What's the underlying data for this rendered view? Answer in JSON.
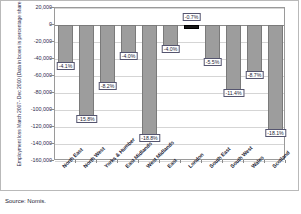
{
  "figure": {
    "y_axis_title_line1": "Employment loss March 2007- Dec 2010",
    "y_axis_title_line2": "(Data in boxes is percentage share of losses)",
    "source_note": "Source: Nomis."
  },
  "chart_data": {
    "type": "bar",
    "title": "",
    "subtitle": "",
    "xlabel": "",
    "ylabel": "Employment loss March 2007- Dec 2010 (Data in boxes is percentage share of losses)",
    "categories": [
      "North East",
      "North West",
      "Yorks & Humber",
      "East Midlands",
      "West Midlands",
      "East",
      "London",
      "South East",
      "South West",
      "Wales",
      "Scotland"
    ],
    "values": [
      -48000,
      -110000,
      -72000,
      -36000,
      -133000,
      -28000,
      -5000,
      -44000,
      -80000,
      -59000,
      -127000
    ],
    "data_labels": [
      "-4.1%",
      "-15.8%",
      "-8.2%",
      "-4.0%",
      "-18.8%",
      "-4.0%",
      "-0.7%",
      "-5.5%",
      "-11.4%",
      "-8.7%",
      "-18.1%"
    ],
    "ylim": [
      -160000,
      20000
    ],
    "ytick_labels": [
      "20,000",
      "0",
      "-20,000",
      "-40,000",
      "-60,000",
      "-80,000",
      "-100,000",
      "-120,000",
      "-140,000",
      "-160,000"
    ],
    "ytick_values": [
      20000,
      0,
      -20000,
      -40000,
      -60000,
      -80000,
      -100000,
      -120000,
      -140000,
      -160000
    ],
    "grid": true,
    "legend": "none",
    "bar_color": "#9d9d9d",
    "highlight_bar_color": "#171717",
    "highlight_category": "London",
    "annotations": [
      "Source: Nomis."
    ]
  }
}
